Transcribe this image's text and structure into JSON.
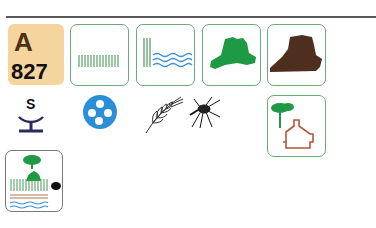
{
  "header": {
    "rule": true
  },
  "code": {
    "letter": "A",
    "number": "827",
    "background": "#f6d49e"
  },
  "row1_tiles": [
    {
      "name": "grassland-icon",
      "border": "#6aab78"
    },
    {
      "name": "reeds-water-icon",
      "border": "#6aab78"
    },
    {
      "name": "green-hill-icon",
      "fill": "#1e9a45"
    },
    {
      "name": "brown-rock-icon",
      "fill": "#4e2e1c"
    }
  ],
  "row2_symbols": [
    {
      "name": "salt-marsh-symbol",
      "letter": "S",
      "color": "#2b2a5e"
    },
    {
      "name": "four-dot-disc-icon",
      "color": "#2a8fd8"
    },
    {
      "name": "wheat-icon"
    },
    {
      "name": "mosquito-icon"
    },
    {
      "name": "tree-house-icon",
      "tree": "#1e9a45",
      "house": "#b5553c"
    }
  ],
  "row3_tiles": [
    {
      "name": "wetland-tree-icon"
    }
  ],
  "colors": {
    "tile_border": "#6aab78",
    "water": "#3a8fd6",
    "green": "#1e9a45"
  }
}
